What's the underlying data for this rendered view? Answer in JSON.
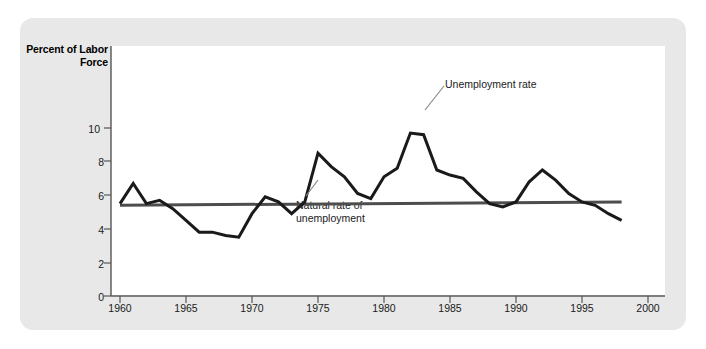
{
  "figure": {
    "y_axis_title": "Percent of\nLabor Force",
    "panel_color": "#e8e8e8",
    "canvas_color": "#ffffff",
    "series_color": "#1a1a1a",
    "natural_rate_color": "#4d4d4d"
  },
  "annotations": {
    "unemployment_label": "Unemployment rate",
    "natural_label": "Natural rate of\nunemployment"
  },
  "ticks": {
    "y": [
      "0",
      "2",
      "4",
      "6",
      "8",
      "10"
    ],
    "x": [
      "1960",
      "1965",
      "1970",
      "1975",
      "1980",
      "1985",
      "1990",
      "1995",
      "2000"
    ]
  },
  "chart_data": {
    "type": "line",
    "title": "",
    "xlabel": "",
    "ylabel": "Percent of Labor Force",
    "xlim": [
      1960,
      2000
    ],
    "ylim": [
      0,
      11
    ],
    "grid": false,
    "legend": "annotations",
    "series": [
      {
        "name": "Unemployment rate",
        "x": [
          1960,
          1961,
          1962,
          1963,
          1964,
          1965,
          1966,
          1967,
          1968,
          1969,
          1970,
          1971,
          1972,
          1973,
          1974,
          1975,
          1976,
          1977,
          1978,
          1979,
          1980,
          1981,
          1982,
          1983,
          1984,
          1985,
          1986,
          1987,
          1988,
          1989,
          1990,
          1991,
          1992,
          1993,
          1994,
          1995,
          1996,
          1997,
          1998
        ],
        "values": [
          5.5,
          6.7,
          5.5,
          5.7,
          5.2,
          4.5,
          3.8,
          3.8,
          3.6,
          3.5,
          4.9,
          5.9,
          5.6,
          4.9,
          5.6,
          8.5,
          7.7,
          7.1,
          6.1,
          5.8,
          7.1,
          7.6,
          9.7,
          9.6,
          7.5,
          7.2,
          7.0,
          6.2,
          5.5,
          5.3,
          5.6,
          6.8,
          7.5,
          6.9,
          6.1,
          5.6,
          5.4,
          4.9,
          4.5
        ]
      },
      {
        "name": "Natural rate of unemployment",
        "x": [
          1960,
          1998
        ],
        "values": [
          5.4,
          5.6
        ]
      }
    ]
  }
}
